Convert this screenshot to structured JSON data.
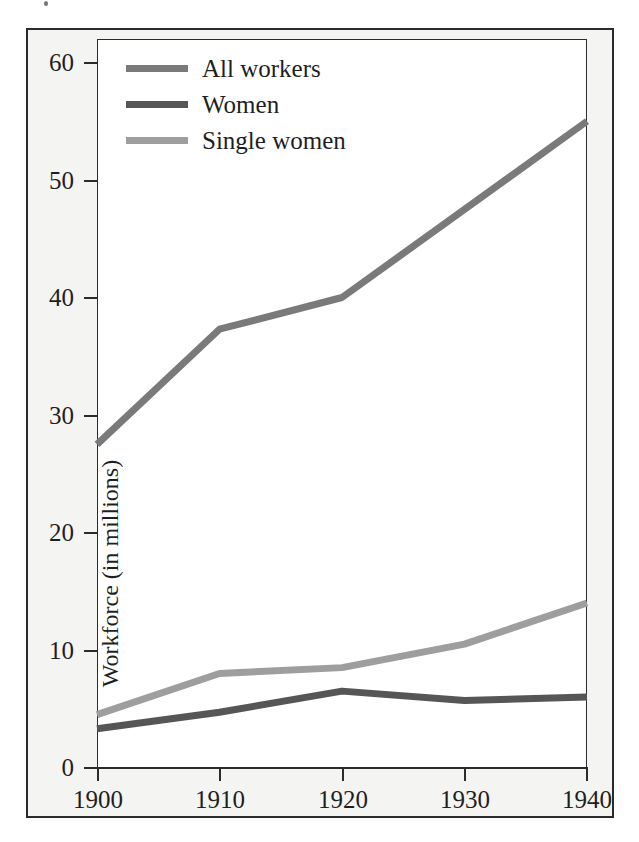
{
  "figure": {
    "border_color": "#2b2b2b",
    "page_background": "#f4f4f2",
    "plot_background": "#ffffff"
  },
  "chart_data": {
    "type": "line",
    "title": "",
    "subtitle": "",
    "xlabel": "",
    "ylabel": "Workforce (in millions)",
    "x": [
      1900,
      1910,
      1920,
      1930,
      1940
    ],
    "xtick_labels": [
      "1900",
      "1910",
      "1920",
      "1930",
      "1940"
    ],
    "ytick_labels": [
      "0",
      "10",
      "20",
      "30",
      "40",
      "50",
      "60"
    ],
    "yticks": [
      0,
      10,
      20,
      30,
      40,
      50,
      60
    ],
    "xlim": [
      1900,
      1940
    ],
    "ylim": [
      0,
      60
    ],
    "grid": false,
    "legend_position": "top-left-inside",
    "series": [
      {
        "name": "All workers",
        "color": "#7a7a7a",
        "values": [
          27.5,
          37.3,
          40.0,
          47.5,
          55.0
        ]
      },
      {
        "name": "Women",
        "color": "#565656",
        "values": [
          3.3,
          4.7,
          6.5,
          5.7,
          6.0
        ]
      },
      {
        "name": "Single women",
        "color": "#9e9e9e",
        "values": [
          4.5,
          8.0,
          8.5,
          10.5,
          14.0
        ]
      }
    ]
  },
  "axis": {
    "y_title": "Workforce (in millions)",
    "y_labels": [
      "60",
      "50",
      "40",
      "30",
      "20",
      "10",
      "0"
    ],
    "x_labels": [
      "1900",
      "1910",
      "1920",
      "1930",
      "1940"
    ]
  },
  "legend": {
    "items": [
      {
        "label": "All workers",
        "color": "#7a7a7a"
      },
      {
        "label": "Women",
        "color": "#565656"
      },
      {
        "label": "Single women",
        "color": "#9e9e9e"
      }
    ]
  }
}
